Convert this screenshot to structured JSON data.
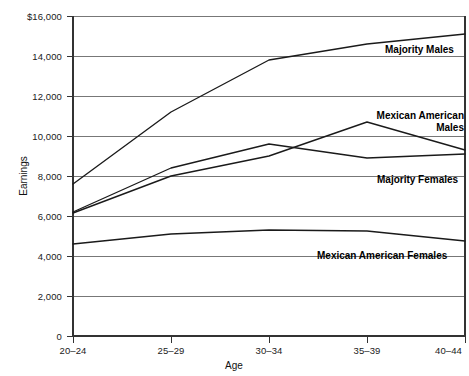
{
  "chart_data": {
    "type": "line",
    "title": "",
    "xlabel": "Age",
    "ylabel": "Earnings",
    "categories": [
      "20–24",
      "25–29",
      "30–34",
      "35–39",
      "40–44"
    ],
    "ylim": [
      0,
      16000
    ],
    "yticks": [
      0,
      2000,
      4000,
      6000,
      8000,
      10000,
      12000,
      14000,
      16000
    ],
    "ytick_labels": [
      "0",
      "2,000",
      "4,000",
      "6,000",
      "8,000",
      "10,000",
      "12,000",
      "14,000",
      "$16,000"
    ],
    "grid": true,
    "legend_position": "inline-right-of-lines",
    "series": [
      {
        "name": "Majority Males",
        "label_lines": [
          "Majority Males"
        ],
        "values": [
          7600,
          11200,
          13800,
          14600,
          15100
        ],
        "color": "#1a1a1a"
      },
      {
        "name": "Mexican American Males",
        "label_lines": [
          "Mexican American",
          "Males"
        ],
        "values": [
          6150,
          8000,
          9000,
          10700,
          9300
        ],
        "color": "#1a1a1a"
      },
      {
        "name": "Majority Females",
        "label_lines": [
          "Majority Females"
        ],
        "values": [
          6200,
          8400,
          9600,
          8900,
          9100
        ],
        "color": "#1a1a1a"
      },
      {
        "name": "Mexican American Females",
        "label_lines": [
          "Mexican American Females"
        ],
        "values": [
          4600,
          5100,
          5300,
          5250,
          4750
        ],
        "color": "#1a1a1a"
      }
    ]
  },
  "axes": {
    "y_title": "Earnings",
    "x_title": "Age",
    "ytick_0": "0",
    "ytick_1": "2,000",
    "ytick_2": "4,000",
    "ytick_3": "6,000",
    "ytick_4": "8,000",
    "ytick_5": "10,000",
    "ytick_6": "12,000",
    "ytick_7": "14,000",
    "ytick_8": "$16,000",
    "xtick_0": "20–24",
    "xtick_1": "25–29",
    "xtick_2": "30–34",
    "xtick_3": "35–39",
    "xtick_4": "40–44"
  },
  "series_labels": {
    "majority_males": "Majority Males",
    "mexican_american_males_line1": "Mexican American",
    "mexican_american_males_line2": "Males",
    "majority_females": "Majority Females",
    "mexican_american_females": "Mexican American Females"
  },
  "colors": {
    "line": "#1a1a1a",
    "grid": "#555555",
    "axis": "#333333",
    "text": "#111111",
    "background": "#ffffff"
  }
}
